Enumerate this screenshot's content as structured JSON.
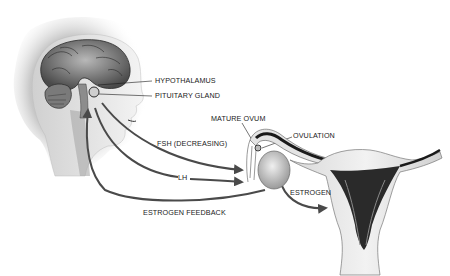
{
  "diagram": {
    "type": "medical-illustration",
    "colors": {
      "background": "#ffffff",
      "ink": "#1a1a1a",
      "arrow": "#4a4a4a",
      "tissue_light": "#e6e6e6",
      "tissue_mid": "#b5b5b5",
      "tissue_dark": "#2a2a2a"
    },
    "labels": {
      "hypothalamus": "HYPOTHALAMUS",
      "pituitary": "PITUITARY GLAND",
      "mature_ovum": "MATURE OVUM",
      "ovulation": "OVULATION",
      "fsh": "FSH (DECREASING)",
      "lh": "LH",
      "estrogen": "ESTROGEN",
      "estrogen_feedback": "ESTROGEN FEEDBACK"
    },
    "arrows": [
      {
        "name": "FSH (DECREASING)",
        "from": "pituitary gland",
        "to": "ovary"
      },
      {
        "name": "LH",
        "from": "pituitary gland",
        "to": "ovary"
      },
      {
        "name": "ESTROGEN FEEDBACK",
        "from": "ovary",
        "to": "pituitary gland"
      },
      {
        "name": "ESTROGEN",
        "from": "ovary",
        "to": "uterus"
      }
    ]
  }
}
